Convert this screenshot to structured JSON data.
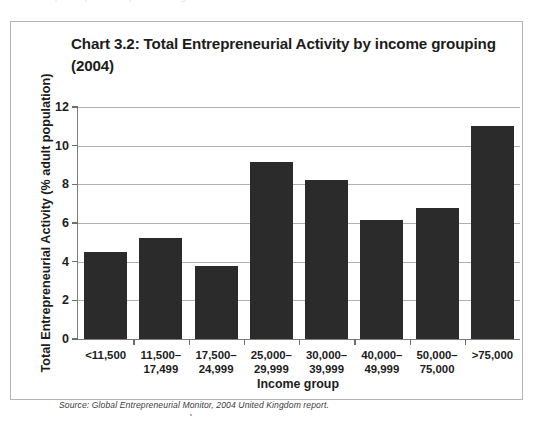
{
  "figure": {
    "title": "Chart 3.2: Total Entrepreneurial Activity by income grouping (2004)",
    "source_note": "Source: Global Entrepreneurial Monitor, 2004 United Kingdom report.",
    "frame_color": "#b4b4b4",
    "bar_color": "#2b2b2b",
    "gridline_color": "#b0b0b0",
    "axis_color": "#7d7d7d",
    "text_color": "#1c1c1c"
  },
  "scan_artifact_text": "a  b  e  r  o  f    p  e  o  p  l  e    r  e  p  o  r  t  i  n  g",
  "chart_data": {
    "type": "bar",
    "title": "Chart 3.2: Total Entrepreneurial Activity by income grouping (2004)",
    "xlabel": "Income group",
    "ylabel": "Total Entrepreneurial Activity (% adult population)",
    "categories": [
      "<11,500",
      "11,500–\n17,499",
      "17,500–\n24,999",
      "25,000–\n29,999",
      "30,000–\n39,999",
      "40,000–\n49,999",
      "50,000–\n75,000",
      ">75,000"
    ],
    "values": [
      4.5,
      5.25,
      3.8,
      9.15,
      8.25,
      6.15,
      6.8,
      11.0
    ],
    "ylim": [
      0,
      12
    ],
    "yticks": [
      0,
      2,
      4,
      6,
      8,
      10,
      12
    ],
    "ytick_labels": [
      "0",
      "2",
      "4",
      "6",
      "8",
      "10",
      "12"
    ],
    "grid": true,
    "legend": false
  }
}
